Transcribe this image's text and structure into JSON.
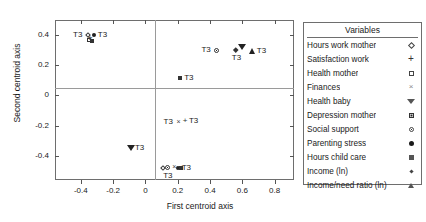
{
  "chart_data": {
    "type": "scatter",
    "title": "",
    "xlabel": "First centroid axis",
    "ylabel": "Second centroid axis",
    "xlim": [
      -0.56,
      0.92
    ],
    "ylim": [
      -0.56,
      0.5
    ],
    "xticks": [
      -0.4,
      -0.2,
      0,
      0.2,
      0.4,
      0.6,
      0.8
    ],
    "xticklabels": [
      "-0.4",
      "-0.2",
      "0",
      "0.2",
      "0.4",
      "0.6",
      "0.8"
    ],
    "yticks": [
      0.4,
      0.2,
      0,
      -0.2,
      -0.4
    ],
    "yticklabels": [
      "0.4",
      "0.2",
      "0",
      "-0.2",
      "-0.4"
    ],
    "grid": false,
    "zero_lines": true,
    "legend_position": "right-outside",
    "point_label": "T3",
    "points": [
      {
        "id": "p1",
        "variable": "Hours work mother",
        "marker": "open-diamond",
        "x": -0.355,
        "y": 0.4,
        "label": "T3",
        "label_side": "left"
      },
      {
        "id": "p2",
        "variable": "Satisfaction work",
        "marker": "plus",
        "x": -0.345,
        "y": 0.378,
        "label": "",
        "label_side": "none"
      },
      {
        "id": "p3",
        "variable": "Health mother",
        "marker": "open-square",
        "x": -0.352,
        "y": 0.368,
        "label": "",
        "label_side": "none"
      },
      {
        "id": "p4",
        "variable": "Finances",
        "marker": "cross",
        "x": -0.34,
        "y": 0.372,
        "label": "",
        "label_side": "none"
      },
      {
        "id": "p5",
        "variable": "Parenting stress",
        "marker": "filled-circle",
        "x": -0.32,
        "y": 0.398,
        "label": "T3",
        "label_side": "right"
      },
      {
        "id": "p6",
        "variable": "Hours child care",
        "marker": "filled-square",
        "x": -0.33,
        "y": 0.36,
        "label": "",
        "label_side": "none"
      },
      {
        "id": "p7",
        "variable": "Social support",
        "marker": "circle-dot",
        "x": 0.44,
        "y": 0.298,
        "label": "T3",
        "label_side": "left"
      },
      {
        "id": "p8",
        "variable": "Income (ln)",
        "marker": "diamond",
        "x": 0.56,
        "y": 0.3,
        "label": "T3",
        "label_side": "below"
      },
      {
        "id": "p9",
        "variable": "Income/need ratio (ln)",
        "marker": "triangle-up",
        "x": 0.665,
        "y": 0.295,
        "label": "T3",
        "label_side": "right"
      },
      {
        "id": "p10",
        "variable": "Health baby",
        "marker": "triangle-down",
        "x": 0.6,
        "y": 0.318,
        "label": "",
        "label_side": "none"
      },
      {
        "id": "p11",
        "variable": "Depression mother",
        "marker": "filled-square",
        "x": 0.215,
        "y": 0.115,
        "label": "T3",
        "label_side": "right"
      },
      {
        "id": "p12",
        "variable": "Health mother",
        "marker": "cross",
        "x": 0.205,
        "y": -0.175,
        "label": "T3",
        "label_side": "left"
      },
      {
        "id": "p13",
        "variable": "Satisfaction work",
        "marker": "plus",
        "x": 0.245,
        "y": -0.172,
        "label": "T3",
        "label_side": "right"
      },
      {
        "id": "p14",
        "variable": "Health baby",
        "marker": "triangle-down",
        "x": -0.09,
        "y": -0.345,
        "label": "T3",
        "label_side": "right"
      },
      {
        "id": "p15",
        "variable": "Hours work mother",
        "marker": "open-diamond",
        "x": 0.11,
        "y": -0.48,
        "label": "",
        "label_side": "none"
      },
      {
        "id": "p16",
        "variable": "Social support",
        "marker": "circle-dot",
        "x": 0.135,
        "y": -0.478,
        "label": "T3",
        "label_side": "below"
      },
      {
        "id": "p17",
        "variable": "Finances",
        "marker": "cross",
        "x": 0.178,
        "y": -0.475,
        "label": "",
        "label_side": "none"
      },
      {
        "id": "p18",
        "variable": "Parenting stress",
        "marker": "filled-circle",
        "x": 0.2,
        "y": -0.48,
        "label": "T3",
        "label_side": "right"
      },
      {
        "id": "p19",
        "variable": "Hours child care",
        "marker": "filled-square",
        "x": 0.222,
        "y": -0.482,
        "label": "",
        "label_side": "none"
      }
    ]
  },
  "legend": {
    "title": "Variables",
    "items": [
      {
        "label": "Hours work mother",
        "marker": "open-diamond"
      },
      {
        "label": "Satisfaction work",
        "marker": "plus"
      },
      {
        "label": "Health mother",
        "marker": "open-square"
      },
      {
        "label": "Finances",
        "marker": "cross"
      },
      {
        "label": "Health baby",
        "marker": "triangle-down"
      },
      {
        "label": "Depression mother",
        "marker": "square-dot"
      },
      {
        "label": "Social support",
        "marker": "circle-dot"
      },
      {
        "label": "Parenting stress",
        "marker": "filled-circle"
      },
      {
        "label": "Hours child care",
        "marker": "filled-square"
      },
      {
        "label": "Income (ln)",
        "marker": "small-diamond"
      },
      {
        "label": "Income/need ratio (ln)",
        "marker": "triangle-up"
      }
    ]
  }
}
